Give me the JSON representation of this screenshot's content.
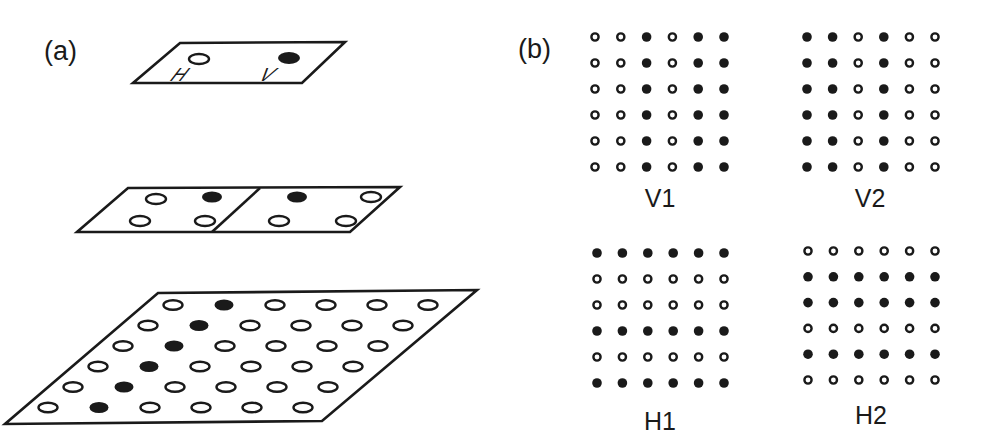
{
  "panel_a": {
    "label": "(a)",
    "top_layer": {
      "letters": [
        "H",
        "V"
      ],
      "units": [
        {
          "id": "H",
          "filled": false
        },
        {
          "id": "V",
          "filled": true
        }
      ]
    },
    "middle_layer": {
      "cells": [
        {
          "dots": [
            {
              "pos": "top-left",
              "filled": false
            },
            {
              "pos": "top-right",
              "filled": true
            },
            {
              "pos": "bottom-left",
              "filled": false
            },
            {
              "pos": "bottom-right",
              "filled": false
            }
          ]
        },
        {
          "dots": [
            {
              "pos": "top-left",
              "filled": true
            },
            {
              "pos": "top-right",
              "filled": false
            },
            {
              "pos": "bottom-left",
              "filled": false
            },
            {
              "pos": "bottom-right",
              "filled": false
            }
          ]
        }
      ]
    },
    "bottom_layer": {
      "rows": 6,
      "cols": 6,
      "filled_column_index": 1
    }
  },
  "panel_b": {
    "label": "(b)",
    "grids": [
      {
        "name": "V1",
        "pattern": [
          [
            0,
            0,
            1,
            0,
            1,
            1
          ],
          [
            0,
            0,
            1,
            0,
            1,
            1
          ],
          [
            0,
            0,
            1,
            0,
            1,
            1
          ],
          [
            0,
            0,
            1,
            0,
            1,
            1
          ],
          [
            0,
            0,
            1,
            0,
            1,
            1
          ],
          [
            0,
            0,
            1,
            0,
            1,
            1
          ]
        ]
      },
      {
        "name": "V2",
        "pattern": [
          [
            1,
            1,
            0,
            1,
            0,
            0
          ],
          [
            1,
            1,
            0,
            1,
            0,
            0
          ],
          [
            1,
            1,
            0,
            1,
            0,
            0
          ],
          [
            1,
            1,
            0,
            1,
            0,
            0
          ],
          [
            1,
            1,
            0,
            1,
            0,
            0
          ],
          [
            1,
            1,
            0,
            1,
            0,
            0
          ]
        ]
      },
      {
        "name": "H1",
        "pattern": [
          [
            1,
            1,
            1,
            1,
            1,
            1
          ],
          [
            0,
            0,
            0,
            0,
            0,
            0
          ],
          [
            0,
            0,
            0,
            0,
            0,
            0
          ],
          [
            1,
            1,
            1,
            1,
            1,
            1
          ],
          [
            0,
            0,
            0,
            0,
            0,
            0
          ],
          [
            1,
            1,
            1,
            1,
            1,
            1
          ]
        ]
      },
      {
        "name": "H2",
        "pattern": [
          [
            0,
            0,
            0,
            0,
            0,
            0
          ],
          [
            1,
            1,
            1,
            1,
            1,
            1
          ],
          [
            1,
            1,
            1,
            1,
            1,
            1
          ],
          [
            0,
            0,
            0,
            0,
            0,
            0
          ],
          [
            1,
            1,
            1,
            1,
            1,
            1
          ],
          [
            0,
            0,
            0,
            0,
            0,
            0
          ]
        ]
      }
    ]
  },
  "colors": {
    "ink": "#1a1a1a",
    "background": "#ffffff"
  }
}
